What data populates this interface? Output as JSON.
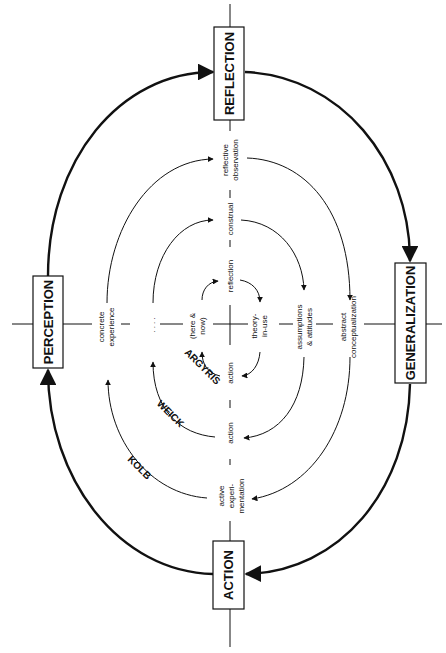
{
  "diagram": {
    "orientation": "rotated 90 degrees counter-clockwise",
    "stages": {
      "top": "REFLECTION",
      "right": "GENERALIZATION",
      "bottom": "ACTION",
      "left": "PERCEPTION"
    },
    "rings": [
      {
        "name": "KOLB",
        "top": [
          "reflective",
          "observation"
        ],
        "right": [
          "abstract",
          "conceptualization"
        ],
        "bottom": [
          "active",
          "experi-",
          "mentation"
        ],
        "left": [
          "concrete",
          "experience"
        ]
      },
      {
        "name": "WEICK",
        "top": [
          "construal"
        ],
        "right": [
          "assumptions",
          "& attitudes"
        ],
        "bottom": [
          "action"
        ],
        "left": [
          ". . . ."
        ]
      },
      {
        "name": "ARGYRIS",
        "top": [
          "reflection"
        ],
        "right": [
          "theory-",
          "in-use"
        ],
        "bottom": [
          "action"
        ],
        "left": [
          "(here &",
          "now)"
        ]
      }
    ],
    "colors": {
      "ink": "#111111",
      "background": "#ffffff"
    }
  }
}
